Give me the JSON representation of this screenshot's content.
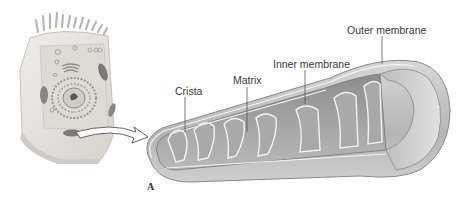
{
  "figure": {
    "panel_letter": "A",
    "labels": {
      "outer_membrane": "Outer membrane",
      "inner_membrane": "Inner membrane",
      "matrix": "Matrix",
      "crista": "Crista"
    },
    "colors": {
      "background": "#ffffff",
      "cell_body": "#e4e2df",
      "cell_edge": "#c9c6c2",
      "mito_outer": "#bdbdbd",
      "mito_inner": "#9a9a9a",
      "membrane_highlight": "#f2f2f2",
      "label_text": "#3a3a3a",
      "leader_line": "#555555"
    }
  }
}
